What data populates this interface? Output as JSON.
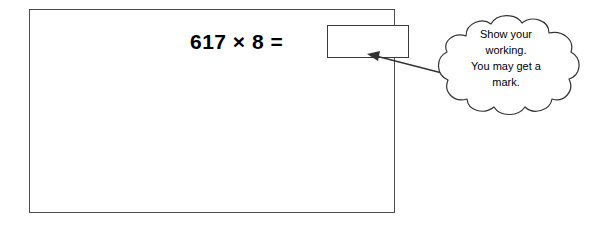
{
  "question": {
    "equation": "617 × 8 =",
    "operand_left": "617",
    "operator": "×",
    "operand_right": "8",
    "equals": "=",
    "answer_value": "",
    "answer_placeholder": ""
  },
  "callout": {
    "shape": "thought-cloud",
    "lines": [
      "Show your",
      "working.",
      "You may get a",
      "mark."
    ],
    "full_text": "Show your working. You may get a mark."
  },
  "colors": {
    "background": "#ffffff",
    "outline": "#4d4d4d",
    "answer_box_border": "#3a3a3a",
    "callout_outline": "#333333",
    "text": "#000000"
  }
}
